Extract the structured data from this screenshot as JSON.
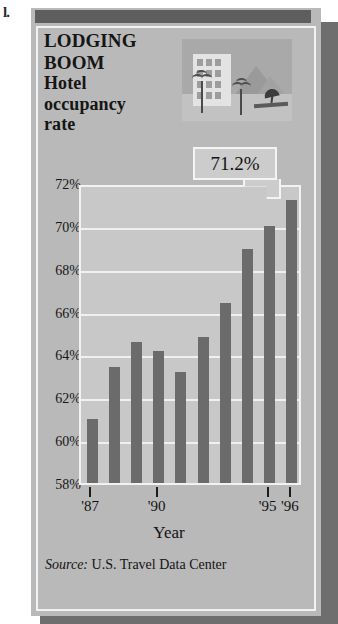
{
  "page_artifact": "l.",
  "headline": {
    "line1": "LODGING",
    "line2": "BOOM",
    "line3": "Hotel",
    "line4": "occupancy",
    "line5": "rate"
  },
  "callout": {
    "value": "71.2%"
  },
  "illustration": {
    "name": "beach-resort-illustration"
  },
  "source": {
    "label": "Source:",
    "text": "U.S. Travel Data Center"
  },
  "colors": {
    "card_bg": "#b9b9b9",
    "plot_bg": "#c8c8c8",
    "bar": "#6b6b6b",
    "gridline": "#f0f0f0",
    "header_bar": "#5e5e5e",
    "text": "#141414"
  },
  "chart_data": {
    "type": "bar",
    "title": "LODGING BOOM Hotel occupancy rate",
    "xlabel": "Year",
    "ylabel": "",
    "ylim": [
      58,
      72
    ],
    "ytick_values": [
      58,
      60,
      62,
      64,
      66,
      68,
      70,
      72
    ],
    "ytick_labels": [
      "58%",
      "60%",
      "62%",
      "64%",
      "66%",
      "68%",
      "70%",
      "72%"
    ],
    "grid": true,
    "legend": false,
    "categories": [
      "1987",
      "1988",
      "1989",
      "1990",
      "1991",
      "1992",
      "1993",
      "1994",
      "1995",
      "1996"
    ],
    "xtick_labels": [
      "'87",
      "",
      "",
      "'90",
      "",
      "",
      "",
      "",
      "'95",
      "'96"
    ],
    "values": [
      61.0,
      63.4,
      64.6,
      64.15,
      63.2,
      64.8,
      66.4,
      68.9,
      70.0,
      71.2
    ],
    "annotations": [
      {
        "text": "71.2%",
        "target_category": "1996",
        "value": 71.2
      }
    ],
    "source": "Source: U.S. Travel Data Center"
  }
}
